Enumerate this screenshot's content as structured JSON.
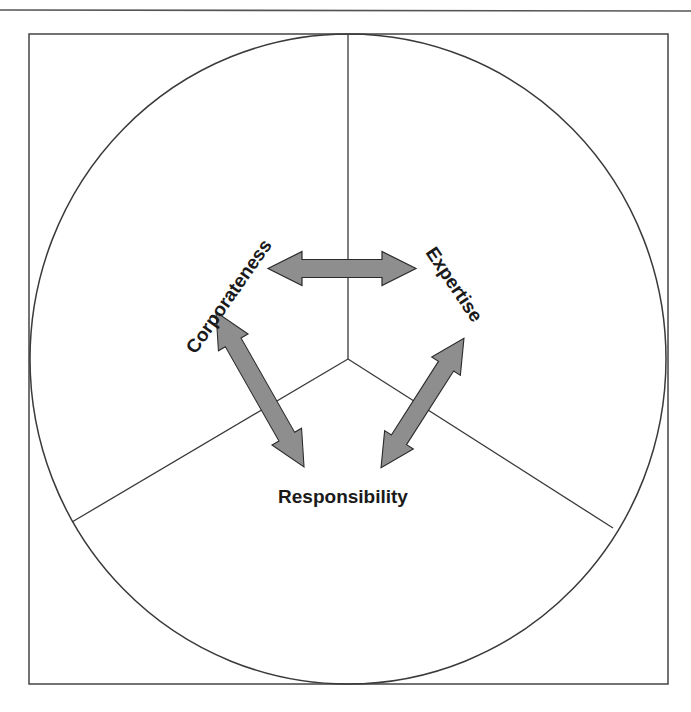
{
  "diagram": {
    "type": "triangular relationship diagram (circle divided into three sectors)",
    "labels": {
      "top_left": "Corporateness",
      "top_right": "Expertise",
      "bottom": "Responsibility"
    },
    "relationships": [
      {
        "from": "Corporateness",
        "to": "Expertise",
        "style": "double-headed arrow"
      },
      {
        "from": "Corporateness",
        "to": "Responsibility",
        "style": "double-headed arrow"
      },
      {
        "from": "Expertise",
        "to": "Responsibility",
        "style": "double-headed arrow"
      }
    ],
    "colors": {
      "line": "#333333",
      "arrow_fill": "#8e8e8e",
      "arrow_stroke": "#2a2a2a",
      "text": "#1a1a1a",
      "background": "#ffffff"
    }
  }
}
